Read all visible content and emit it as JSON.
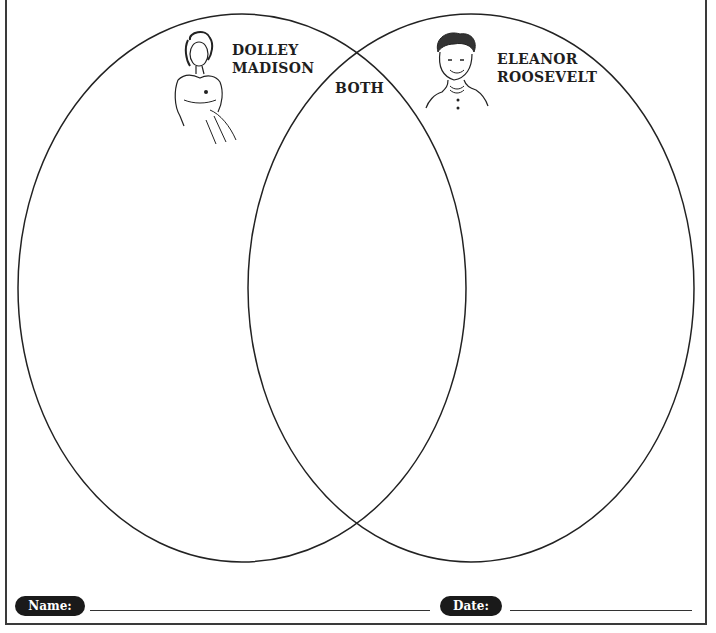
{
  "worksheet": {
    "title": "Venn Diagram",
    "left_circle": {
      "label_line1": "DOLLEY",
      "label_line2": "MADISON",
      "portrait": "dolley-madison-portrait"
    },
    "right_circle": {
      "label_line1": "ELEANOR",
      "label_line2": "ROOSEVELT",
      "portrait": "eleanor-roosevelt-portrait"
    },
    "overlap": {
      "label": "BOTH"
    },
    "footer": {
      "name_label": "Name:",
      "name_value": "",
      "date_label": "Date:",
      "date_value": ""
    }
  },
  "colors": {
    "ink": "#1e1e1e",
    "background": "#ffffff"
  }
}
